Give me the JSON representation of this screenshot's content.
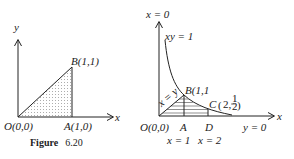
{
  "figure_left": {
    "axis_y_label": "y",
    "axis_x_label": "x",
    "point_B": "B(1,1)",
    "point_O": "O(0,0)",
    "point_A": "A(1,0)",
    "caption_bold": "Figure",
    "caption_num": "6.20"
  },
  "figure_right": {
    "y_axis_label": "x = 0",
    "curve_label": "xy = 1",
    "line_label": "x = y",
    "point_B": "B(1,1",
    "point_C_prefix": "C",
    "point_C_coord": "2,",
    "point_C_frac_num": "1",
    "point_C_frac_den": "2",
    "point_O": "O(0,0)",
    "point_A": "A",
    "point_D": "D",
    "x_axis_eq": "y = 0",
    "axis_x_label": "x",
    "line_x1": "x = 1",
    "line_x2": "x = 2"
  },
  "colors": {
    "stroke": "#222222",
    "fill_dots": "#555555"
  }
}
